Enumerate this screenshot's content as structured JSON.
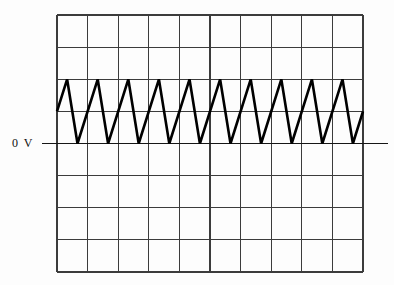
{
  "figure": {
    "background": "#fdfdfd",
    "width_px": 394,
    "height_px": 285
  },
  "chart_data": {
    "type": "line",
    "title": "",
    "waveform": "triangle",
    "zero_reference_label": "0 V",
    "grid": {
      "columns": 10,
      "rows": 8,
      "left_px": 57,
      "top_px": 15,
      "right_px": 363,
      "bottom_px": 272,
      "stroke": "#3c3c3c",
      "stroke_width": 1.2,
      "grid_on": true
    },
    "zero_line": {
      "row_from_top": 4,
      "x_start_px": 42,
      "x_end_px": 388,
      "stroke": "#161616",
      "stroke_width": 1.4
    },
    "trace": {
      "stroke": "#000000",
      "stroke_width": 2.6,
      "cycles": 10,
      "period_divisions": 1,
      "peak_divisions_above_zero": 2,
      "trough_divisions_above_zero": 0,
      "rise_fraction_of_period": 0.67,
      "fall_fraction_of_period": 0.33,
      "points_div": [
        [
          0,
          1
        ],
        [
          0.33,
          2
        ],
        [
          0.67,
          0
        ],
        [
          1.33,
          2
        ],
        [
          1.67,
          0
        ],
        [
          2.33,
          2
        ],
        [
          2.67,
          0
        ],
        [
          3.33,
          2
        ],
        [
          3.67,
          0
        ],
        [
          4.33,
          2
        ],
        [
          4.67,
          0
        ],
        [
          5.33,
          2
        ],
        [
          5.67,
          0
        ],
        [
          6.33,
          2
        ],
        [
          6.67,
          0
        ],
        [
          7.33,
          2
        ],
        [
          7.67,
          0
        ],
        [
          8.33,
          2
        ],
        [
          8.67,
          0
        ],
        [
          9.33,
          2
        ],
        [
          9.67,
          0
        ],
        [
          10,
          1
        ]
      ]
    },
    "xlabel": "",
    "ylabel": "",
    "legend": null
  }
}
